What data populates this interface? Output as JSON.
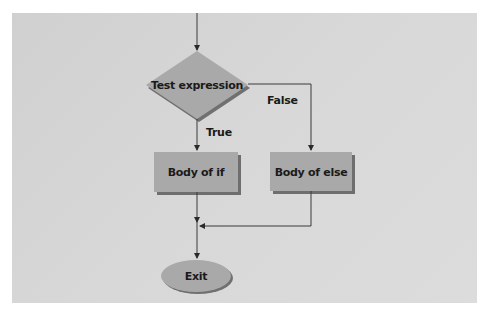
{
  "diagram": {
    "type": "flowchart",
    "title": "",
    "nodes": {
      "decision": {
        "label": "Test expression",
        "shape": "diamond"
      },
      "if_body": {
        "label": "Body of if",
        "shape": "rectangle"
      },
      "else_body": {
        "label": "Body of else",
        "shape": "rectangle"
      },
      "exit": {
        "label": "Exit",
        "shape": "ellipse"
      }
    },
    "edges": {
      "true_label": "True",
      "false_label": "False"
    },
    "colors": {
      "panel_background": "#d4d4d4",
      "shape_fill": "#a9a9a9",
      "shape_shadow": "#707070",
      "line": "#3a3a3a",
      "text": "#1a1a1a"
    }
  }
}
